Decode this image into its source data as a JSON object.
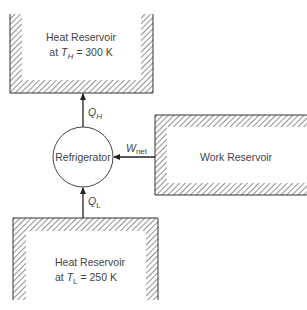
{
  "diagram": {
    "type": "thermodynamic-refrigerator-schematic",
    "colors": {
      "stroke": "#333333",
      "hatch": "#555555",
      "text": "#444444",
      "background": "#ffffff"
    },
    "hot_reservoir": {
      "line1": "Heat Reservoir",
      "line2_prefix": "at ",
      "symbol": "T",
      "subscript": "H",
      "line2_suffix": " = 300 K"
    },
    "cold_reservoir": {
      "line1": "Heat Reservoir",
      "line2_prefix": "at ",
      "symbol": "T",
      "subscript": "L",
      "line2_suffix": " = 250 K"
    },
    "work_reservoir": {
      "label": "Work Reservoir"
    },
    "device": {
      "label": "Refrigerator"
    },
    "flows": {
      "q_hot": {
        "symbol": "Q",
        "subscript": "H",
        "direction": "device-to-hot-reservoir"
      },
      "q_cold": {
        "symbol": "Q",
        "subscript": "L",
        "direction": "cold-reservoir-to-device"
      },
      "work": {
        "symbol": "W",
        "subscript": "net",
        "direction": "work-reservoir-to-device"
      }
    }
  }
}
